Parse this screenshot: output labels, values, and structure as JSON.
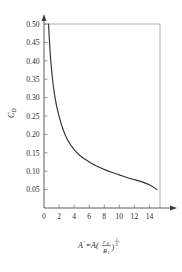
{
  "chart_data": {
    "type": "line",
    "title": "",
    "xlabel": "A' = A(r_0/R_1)^(1/2)",
    "ylabel": "C_D",
    "xlim": [
      0,
      15.4
    ],
    "ylim": [
      0,
      0.5
    ],
    "grid": false,
    "legend": null,
    "xticks": [
      0,
      2,
      4,
      6,
      8,
      10,
      12,
      14
    ],
    "xtick_labels": [
      "0",
      "2",
      "4",
      "6",
      "8",
      "10",
      "12",
      "14"
    ],
    "yticks": [
      0.05,
      0.1,
      0.15,
      0.2,
      0.25,
      0.3,
      0.35,
      0.4,
      0.45,
      0.5
    ],
    "ytick_labels": [
      "0.05",
      "0.10",
      "0.15",
      "0.20",
      "0.25",
      "0.30",
      "0.35",
      "0.40",
      "0.45",
      "0.50"
    ],
    "series": [
      {
        "name": "C_D",
        "x": [
          0.6,
          0.75,
          0.9,
          1.1,
          1.3,
          1.5,
          1.75,
          2.0,
          2.3,
          2.6,
          3.0,
          3.4,
          3.8,
          4.3,
          4.8,
          5.4,
          6.0,
          6.7,
          7.4,
          8.2,
          9.0,
          10.0,
          11.0,
          12.0,
          13.0,
          14.0,
          15.0
        ],
        "y": [
          0.5,
          0.444,
          0.4,
          0.356,
          0.322,
          0.296,
          0.27,
          0.25,
          0.228,
          0.21,
          0.19,
          0.176,
          0.164,
          0.152,
          0.142,
          0.133,
          0.125,
          0.117,
          0.11,
          0.103,
          0.097,
          0.09,
          0.083,
          0.077,
          0.071,
          0.063,
          0.05
        ]
      }
    ]
  },
  "axis_labels": {
    "y_main": "C",
    "y_sub": "D",
    "x_lhs": "A",
    "x_prime": "'",
    "x_eq": "=A(",
    "x_num": "r",
    "x_num_sub": "0",
    "x_den": "R",
    "x_den_sub": "1",
    "x_close": ")",
    "x_exp_num": "1",
    "x_exp_den": "2"
  },
  "colors": {
    "curve": "#333333",
    "frame": "#8a8a8a",
    "axis": "#4a4a4a",
    "text": "#2b2b2b",
    "background": "#ffffff"
  }
}
